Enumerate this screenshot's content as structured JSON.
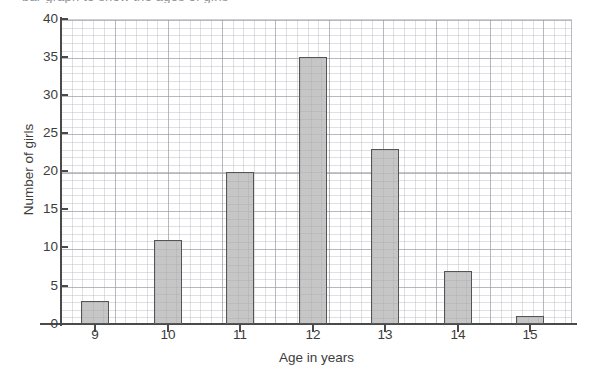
{
  "title_remnant": "bar graph to show the ages of girls",
  "chart_data": {
    "type": "bar",
    "title": "",
    "subtitle": "",
    "xlabel": "Age in years",
    "ylabel": "Number of girls",
    "categories": [
      "9",
      "10",
      "11",
      "12",
      "13",
      "14",
      "15"
    ],
    "values": [
      3,
      11,
      20,
      35,
      23,
      7,
      1
    ],
    "series": [
      {
        "name": "Number of girls",
        "values": [
          3,
          11,
          20,
          35,
          23,
          7,
          1
        ]
      }
    ],
    "ylim": [
      0,
      40
    ],
    "y_ticks": [
      0,
      5,
      10,
      15,
      20,
      25,
      30,
      35,
      40
    ],
    "y_tick_labels": [
      "0",
      "5",
      "10",
      "15",
      "20",
      "25",
      "30",
      "35",
      "40"
    ],
    "y_minor_step": 1,
    "x_tick_labels": [
      "9",
      "10",
      "11",
      "12",
      "13",
      "14",
      "15"
    ],
    "grid": true,
    "grid_minor": true,
    "legend": false,
    "legend_position": "none",
    "bar_fill": "#c6c6c6",
    "bar_edge": "#555555",
    "grid_major_color": "#9696a0",
    "grid_minor_color": "#b2b2ba",
    "axis_color": "#4a4a4a",
    "text_color": "#3c3c3c",
    "background": "#ffffff",
    "annotations": []
  }
}
